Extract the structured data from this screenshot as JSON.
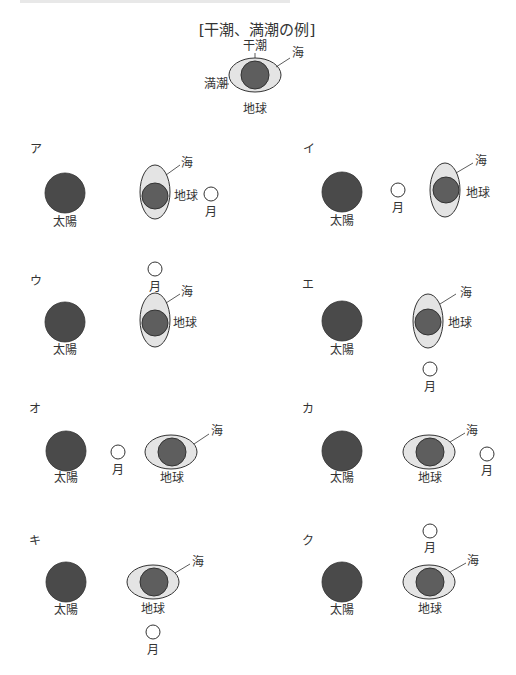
{
  "example": {
    "title": "[干潮、満潮の例]",
    "labels": {
      "low_tide": "干潮",
      "high_tide": "満潮",
      "sea": "海",
      "earth": "地球"
    }
  },
  "labels": {
    "sun": "太陽",
    "earth": "地球",
    "moon": "月",
    "sea": "海"
  },
  "colors": {
    "sun": "#4a4a4a",
    "earth": "#5e5e5e",
    "sea": "#e4e4e4",
    "moon": "#ffffff",
    "outline": "#333333"
  },
  "options": [
    {
      "id": "ア",
      "sea_bulge": "vertical",
      "moon_position": "right of earth"
    },
    {
      "id": "イ",
      "sea_bulge": "vertical",
      "moon_position": "between sun and earth"
    },
    {
      "id": "ウ",
      "sea_bulge": "vertical",
      "moon_position": "above earth"
    },
    {
      "id": "エ",
      "sea_bulge": "vertical",
      "moon_position": "below earth"
    },
    {
      "id": "オ",
      "sea_bulge": "horizontal",
      "moon_position": "between sun and earth"
    },
    {
      "id": "カ",
      "sea_bulge": "horizontal",
      "moon_position": "right of earth"
    },
    {
      "id": "キ",
      "sea_bulge": "horizontal",
      "moon_position": "below earth"
    },
    {
      "id": "ク",
      "sea_bulge": "horizontal",
      "moon_position": "above earth"
    }
  ]
}
